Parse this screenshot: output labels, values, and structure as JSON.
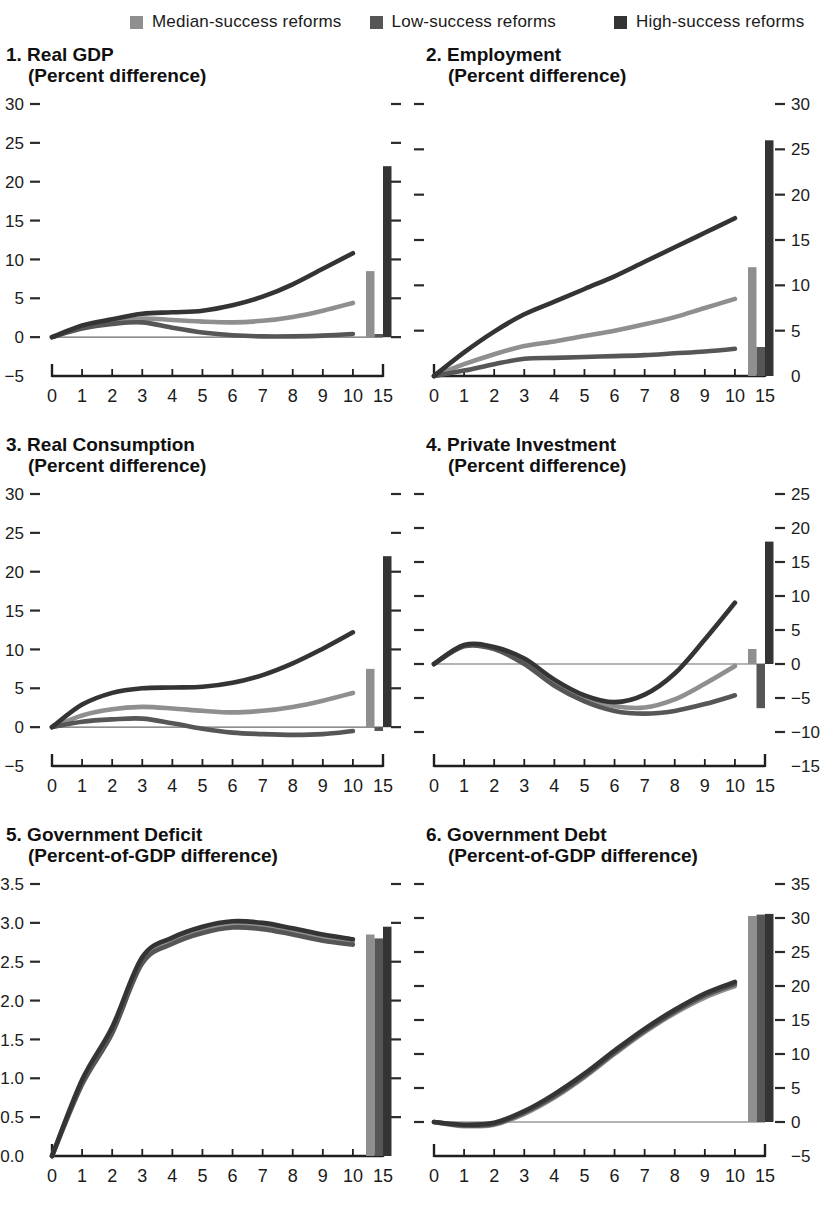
{
  "legend": {
    "items": [
      {
        "label": "Median-success reforms",
        "color": "#8f8f8f"
      },
      {
        "label": "Low-success reforms",
        "color": "#565656"
      },
      {
        "label": "High-success reforms",
        "color": "#343434"
      }
    ]
  },
  "chart_data": [
    {
      "type": "line+bar",
      "title": "1. Real GDP",
      "subtitle": "(Percent difference)",
      "ylabel_side": "left",
      "ylim": [
        -5,
        30
      ],
      "ytick_step": 5,
      "ytick_decimals": 0,
      "zero_line": true,
      "x": [
        0,
        1,
        2,
        3,
        4,
        5,
        6,
        7,
        8,
        9,
        10
      ],
      "long_run_x": 15,
      "xticklabels": [
        "0",
        "1",
        "2",
        "3",
        "4",
        "5",
        "6",
        "7",
        "8",
        "9",
        "10",
        "15"
      ],
      "series": [
        {
          "name": "Median-success reforms",
          "color": "#8f8f8f",
          "values": [
            0,
            1.3,
            2.0,
            2.4,
            2.2,
            2.0,
            1.9,
            2.1,
            2.6,
            3.4,
            4.4
          ],
          "long_run": 8.5
        },
        {
          "name": "Low-success reforms",
          "color": "#565656",
          "values": [
            0,
            1.1,
            1.7,
            1.9,
            1.2,
            0.6,
            0.25,
            0.1,
            0.1,
            0.2,
            0.4
          ],
          "long_run": 0.4
        },
        {
          "name": "High-success reforms",
          "color": "#343434",
          "values": [
            0,
            1.5,
            2.3,
            3.0,
            3.2,
            3.4,
            4.1,
            5.2,
            6.8,
            8.8,
            10.8
          ],
          "long_run": 22
        }
      ]
    },
    {
      "type": "line+bar",
      "title": "2. Employment",
      "subtitle": "(Percent difference)",
      "ylabel_side": "right",
      "ylim": [
        0,
        30
      ],
      "ytick_step": 5,
      "ytick_decimals": 0,
      "zero_line": false,
      "x": [
        0,
        1,
        2,
        3,
        4,
        5,
        6,
        7,
        8,
        9,
        10
      ],
      "long_run_x": 15,
      "xticklabels": [
        "0",
        "1",
        "2",
        "3",
        "4",
        "5",
        "6",
        "7",
        "8",
        "9",
        "10",
        "15"
      ],
      "series": [
        {
          "name": "Median-success reforms",
          "color": "#8f8f8f",
          "values": [
            0,
            1.3,
            2.4,
            3.3,
            3.8,
            4.4,
            5.0,
            5.7,
            6.5,
            7.5,
            8.5
          ],
          "long_run": 12
        },
        {
          "name": "Low-success reforms",
          "color": "#565656",
          "values": [
            0,
            0.6,
            1.3,
            1.9,
            2.0,
            2.1,
            2.2,
            2.3,
            2.5,
            2.7,
            3.0
          ],
          "long_run": 3.2
        },
        {
          "name": "High-success reforms",
          "color": "#343434",
          "values": [
            0,
            2.6,
            4.9,
            6.8,
            8.2,
            9.6,
            11.0,
            12.6,
            14.2,
            15.8,
            17.4
          ],
          "long_run": 26
        }
      ]
    },
    {
      "type": "line+bar",
      "title": "3. Real Consumption",
      "subtitle": "(Percent difference)",
      "ylabel_side": "left",
      "ylim": [
        -5,
        30
      ],
      "ytick_step": 5,
      "ytick_decimals": 0,
      "zero_line": true,
      "x": [
        0,
        1,
        2,
        3,
        4,
        5,
        6,
        7,
        8,
        9,
        10
      ],
      "long_run_x": 15,
      "xticklabels": [
        "0",
        "1",
        "2",
        "3",
        "4",
        "5",
        "6",
        "7",
        "8",
        "9",
        "10",
        "15"
      ],
      "series": [
        {
          "name": "Median-success reforms",
          "color": "#8f8f8f",
          "values": [
            0,
            1.5,
            2.3,
            2.6,
            2.4,
            2.1,
            1.9,
            2.1,
            2.6,
            3.4,
            4.4
          ],
          "long_run": 7.5
        },
        {
          "name": "Low-success reforms",
          "color": "#565656",
          "values": [
            0,
            0.7,
            1.0,
            1.1,
            0.5,
            -0.2,
            -0.7,
            -0.9,
            -1.0,
            -0.9,
            -0.5
          ],
          "long_run": -0.5
        },
        {
          "name": "High-success reforms",
          "color": "#343434",
          "values": [
            0,
            2.9,
            4.4,
            5.0,
            5.1,
            5.2,
            5.7,
            6.7,
            8.2,
            10.1,
            12.2
          ],
          "long_run": 22
        }
      ]
    },
    {
      "type": "line+bar",
      "title": "4. Private Investment",
      "subtitle": "(Percent difference)",
      "ylabel_side": "right",
      "ylim": [
        -15,
        25
      ],
      "ytick_step": 5,
      "ytick_decimals": 0,
      "zero_line": true,
      "x": [
        0,
        1,
        2,
        3,
        4,
        5,
        6,
        7,
        8,
        9,
        10
      ],
      "long_run_x": 15,
      "xticklabels": [
        "0",
        "1",
        "2",
        "3",
        "4",
        "5",
        "6",
        "7",
        "8",
        "9",
        "10",
        "15"
      ],
      "series": [
        {
          "name": "Median-success reforms",
          "color": "#8f8f8f",
          "values": [
            0,
            2.7,
            2.3,
            0.3,
            -2.8,
            -5.0,
            -6.2,
            -6.4,
            -5.2,
            -2.9,
            -0.3
          ],
          "long_run": 2.2
        },
        {
          "name": "Low-success reforms",
          "color": "#565656",
          "values": [
            0,
            2.6,
            2.2,
            0.0,
            -3.2,
            -5.5,
            -6.9,
            -7.3,
            -6.9,
            -5.9,
            -4.6
          ],
          "long_run": -6.5
        },
        {
          "name": "High-success reforms",
          "color": "#343434",
          "values": [
            0,
            2.8,
            2.5,
            0.8,
            -2.3,
            -4.6,
            -5.6,
            -4.5,
            -1.4,
            3.6,
            9.0
          ],
          "long_run": 18
        }
      ]
    },
    {
      "type": "line+bar",
      "title": "5. Government Deficit",
      "subtitle": "(Percent-of-GDP difference)",
      "ylabel_side": "left",
      "ylim": [
        0,
        3.5
      ],
      "ytick_step": 0.5,
      "ytick_decimals": 1,
      "zero_line": false,
      "x": [
        0,
        1,
        2,
        3,
        4,
        5,
        6,
        7,
        8,
        9,
        10
      ],
      "long_run_x": 15,
      "xticklabels": [
        "0",
        "1",
        "2",
        "3",
        "4",
        "5",
        "6",
        "7",
        "8",
        "9",
        "10",
        "15"
      ],
      "series": [
        {
          "name": "Median-success reforms",
          "color": "#8f8f8f",
          "values": [
            0,
            0.95,
            1.62,
            2.52,
            2.77,
            2.91,
            2.98,
            2.96,
            2.89,
            2.81,
            2.76
          ],
          "long_run": 2.85
        },
        {
          "name": "Low-success reforms",
          "color": "#565656",
          "values": [
            0,
            0.92,
            1.58,
            2.48,
            2.73,
            2.87,
            2.94,
            2.92,
            2.85,
            2.77,
            2.72
          ],
          "long_run": 2.8
        },
        {
          "name": "High-success reforms",
          "color": "#343434",
          "values": [
            0,
            0.98,
            1.66,
            2.56,
            2.81,
            2.95,
            3.02,
            3.0,
            2.93,
            2.85,
            2.79
          ],
          "long_run": 2.95
        }
      ]
    },
    {
      "type": "line+bar",
      "title": "6. Government Debt",
      "subtitle": "(Percent-of-GDP difference)",
      "ylabel_side": "right",
      "ylim": [
        -5,
        35
      ],
      "ytick_step": 5,
      "ytick_decimals": 0,
      "zero_line": true,
      "x": [
        0,
        1,
        2,
        3,
        4,
        5,
        6,
        7,
        8,
        9,
        10
      ],
      "long_run_x": 15,
      "xticklabels": [
        "0",
        "1",
        "2",
        "3",
        "4",
        "5",
        "6",
        "7",
        "8",
        "9",
        "10",
        "15"
      ],
      "series": [
        {
          "name": "Median-success reforms",
          "color": "#8f8f8f",
          "values": [
            0,
            -0.6,
            -0.4,
            1.2,
            3.6,
            6.6,
            10.0,
            13.2,
            16.0,
            18.3,
            20.0
          ],
          "long_run": 30.3
        },
        {
          "name": "Low-success reforms",
          "color": "#565656",
          "values": [
            0,
            -0.5,
            -0.3,
            1.4,
            3.8,
            6.8,
            10.2,
            13.4,
            16.2,
            18.6,
            20.3
          ],
          "long_run": 30.5
        },
        {
          "name": "High-success reforms",
          "color": "#343434",
          "values": [
            0,
            -0.4,
            -0.1,
            1.6,
            4.1,
            7.1,
            10.5,
            13.7,
            16.5,
            18.9,
            20.6
          ],
          "long_run": 30.6
        }
      ]
    }
  ]
}
